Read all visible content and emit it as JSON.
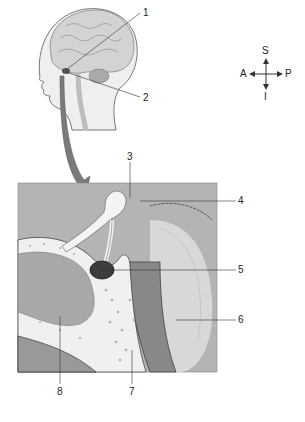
{
  "figure": {
    "type": "anatomical-illustration",
    "labels": [
      {
        "id": "1",
        "text": "1",
        "x": 143,
        "y": 8
      },
      {
        "id": "2",
        "text": "2",
        "x": 143,
        "y": 94
      },
      {
        "id": "3",
        "text": "3",
        "x": 126,
        "y": 153
      },
      {
        "id": "4",
        "text": "4",
        "x": 238,
        "y": 196
      },
      {
        "id": "5",
        "text": "5",
        "x": 238,
        "y": 266
      },
      {
        "id": "6",
        "text": "6",
        "x": 238,
        "y": 316
      },
      {
        "id": "7",
        "text": "7",
        "x": 128,
        "y": 387
      },
      {
        "id": "8",
        "text": "8",
        "x": 56,
        "y": 387
      }
    ],
    "orientation": {
      "superior": "S",
      "inferior": "I",
      "anterior": "A",
      "posterior": "P"
    },
    "colors": {
      "background": "#ffffff",
      "box_bg": "#b4b4b4",
      "arrow": "#7a7a7a",
      "bone": "#f2f2f2",
      "dark": "#3a3a3a",
      "sinus": "#a0a0a0",
      "brain": "#d6d6d6"
    }
  }
}
